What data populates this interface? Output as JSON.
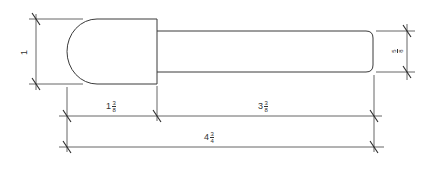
{
  "drawing": {
    "title": "",
    "subject": "Bit with rounded head and shank",
    "units": "inches",
    "colors": {
      "line": "#3a3a3a",
      "text": "#333333",
      "background": "#ffffff"
    }
  },
  "dimensions": {
    "head_height": {
      "text": "1",
      "whole": "1",
      "num": "",
      "den": ""
    },
    "shank_diameter": {
      "text": "5/8",
      "whole": "",
      "num": "5",
      "den": "8"
    },
    "head_length": {
      "text": "1 3/8",
      "whole": "1",
      "num": "3",
      "den": "8"
    },
    "shank_length": {
      "text": "3 3/8",
      "whole": "3",
      "num": "3",
      "den": "8"
    },
    "overall_length": {
      "text": "4 3/4",
      "whole": "4",
      "num": "3",
      "den": "4"
    }
  }
}
